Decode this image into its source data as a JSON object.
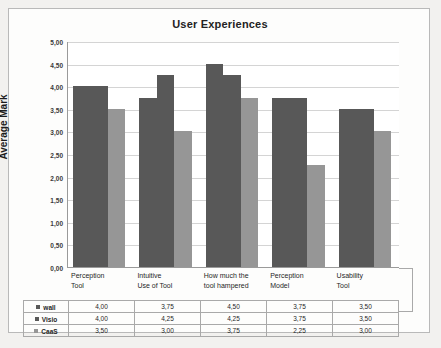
{
  "chart_data": {
    "type": "bar",
    "title": "User Experiences",
    "xlabel": "",
    "ylabel": "Average Mark",
    "ylim": [
      0,
      5
    ],
    "ytick_labels": [
      "5,00",
      "4,50",
      "4,00",
      "3,50",
      "3,00",
      "2,50",
      "2,00",
      "1,50",
      "1,00",
      "0,50",
      "0,00"
    ],
    "ytick_values": [
      5.0,
      4.5,
      4.0,
      3.5,
      3.0,
      2.5,
      2.0,
      1.5,
      1.0,
      0.5,
      0.0
    ],
    "grid": true,
    "legend_position": "table-below",
    "categories": [
      "Perception Tool",
      "Intuitive Use of Tool",
      "How much the tool hampered",
      "Perception Model",
      "Usability Tool"
    ],
    "category_lines": [
      [
        "Perception",
        "Tool"
      ],
      [
        "Intuitive",
        "Use of Tool"
      ],
      [
        "How much the",
        "tool hampered"
      ],
      [
        "Perception",
        "Model"
      ],
      [
        "Usability",
        "Tool"
      ]
    ],
    "series": [
      {
        "name": "wall",
        "color": "#585858",
        "values": [
          4.0,
          3.75,
          4.5,
          3.75,
          3.5
        ],
        "labels": [
          "4,00",
          "3,75",
          "4,50",
          "3,75",
          "3,50"
        ]
      },
      {
        "name": "Visio",
        "color": "#585858",
        "values": [
          4.0,
          4.25,
          4.25,
          3.75,
          3.5
        ],
        "labels": [
          "4,00",
          "4,25",
          "4,25",
          "3,75",
          "3,50"
        ]
      },
      {
        "name": "CaaS",
        "color": "#969696",
        "values": [
          3.5,
          3.0,
          3.75,
          2.25,
          3.0
        ],
        "labels": [
          "3,50",
          "3,00",
          "3,75",
          "2,25",
          "3,00"
        ]
      }
    ]
  },
  "colors": {
    "series_dark": "#585858",
    "series_light": "#969696",
    "gridline": "#d4d4d4",
    "axis": "#9a9a9a",
    "frame": "#b9b9b9",
    "text": "#1f1f1f"
  }
}
